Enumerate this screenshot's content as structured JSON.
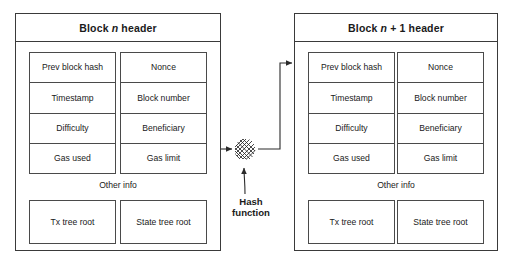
{
  "diagram": {
    "line_color": "#3a3a3a",
    "background": "#ffffff",
    "text_color": "#1a1a1a"
  },
  "blocks": [
    {
      "id": "block-n",
      "header_prefix": "Block",
      "header_variable": "n",
      "header_suffix": "header",
      "left_column": [
        "Prev block hash",
        "Timestamp",
        "Difficulty",
        "Gas used"
      ],
      "right_column": [
        "Nonce",
        "Block number",
        "Beneficiary",
        "Gas limit"
      ],
      "other_info_label": "Other info",
      "roots": [
        "Tx tree root",
        "State tree root"
      ]
    },
    {
      "id": "block-n-plus-1",
      "header_prefix": "Block",
      "header_variable": "n",
      "header_variable_suffix": "+ 1",
      "header_suffix": "header",
      "left_column": [
        "Prev block hash",
        "Timestamp",
        "Difficulty",
        "Gas used"
      ],
      "right_column": [
        "Nonce",
        "Block number",
        "Beneficiary",
        "Gas limit"
      ],
      "other_info_label": "Other info",
      "roots": [
        "Tx tree root",
        "State tree root"
      ]
    }
  ],
  "hash": {
    "label_line1": "Hash",
    "label_line2": "function",
    "icon_name": "hash-mesh-icon"
  }
}
